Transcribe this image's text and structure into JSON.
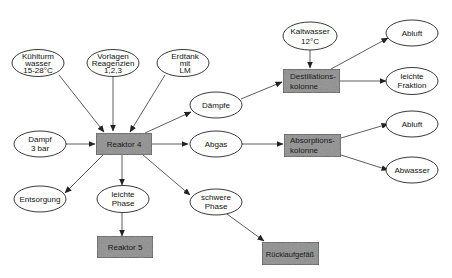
{
  "diagram": {
    "type": "process-flow",
    "nodes": {
      "kuehlturm": {
        "shape": "ellipse",
        "lines": [
          "Kühlturm",
          "wasser",
          "15-28°C"
        ]
      },
      "vorlagen": {
        "shape": "ellipse",
        "lines": [
          "Vorlagen",
          "Reagenzien",
          "1,2,3"
        ]
      },
      "erdtank": {
        "shape": "ellipse",
        "lines": [
          "Erdtank",
          "mit",
          "LM"
        ]
      },
      "dampf": {
        "shape": "ellipse",
        "lines": [
          "Dampf",
          "3 bar"
        ]
      },
      "reaktor4": {
        "shape": "box",
        "lines": [
          "Reaktor 4"
        ]
      },
      "entsorgung": {
        "shape": "ellipse",
        "lines": [
          "Entsorgung"
        ]
      },
      "leichte_phase": {
        "shape": "ellipse",
        "lines": [
          "leichte",
          "Phase"
        ]
      },
      "schwere_phase": {
        "shape": "ellipse",
        "lines": [
          "schwere",
          "Phase"
        ]
      },
      "reaktor5": {
        "shape": "box",
        "lines": [
          "Reaktor 5"
        ]
      },
      "ruecklauf": {
        "shape": "box",
        "lines": [
          "Rücklaufgefäß"
        ]
      },
      "daempfe": {
        "shape": "ellipse",
        "lines": [
          "Dämpfe"
        ]
      },
      "abgas": {
        "shape": "ellipse",
        "lines": [
          "Abgas"
        ]
      },
      "kaltwasser": {
        "shape": "ellipse",
        "lines": [
          "Kaltwasser",
          "12°C"
        ]
      },
      "destillation": {
        "shape": "box",
        "lines": [
          "Destillations-",
          "kolonne"
        ]
      },
      "absorption": {
        "shape": "box",
        "lines": [
          "Absorptions-",
          "kolonne"
        ]
      },
      "abluft1": {
        "shape": "ellipse",
        "lines": [
          "Abluft"
        ]
      },
      "leichte_fraktion": {
        "shape": "ellipse",
        "lines": [
          "leichte",
          "Fraktion"
        ]
      },
      "abluft2": {
        "shape": "ellipse",
        "lines": [
          "Abluft"
        ]
      },
      "abwasser": {
        "shape": "ellipse",
        "lines": [
          "Abwasser"
        ]
      }
    },
    "edges": [
      {
        "from": "kuehlturm",
        "to": "reaktor4"
      },
      {
        "from": "vorlagen",
        "to": "reaktor4"
      },
      {
        "from": "erdtank",
        "to": "reaktor4"
      },
      {
        "from": "dampf",
        "to": "reaktor4"
      },
      {
        "from": "reaktor4",
        "to": "daempfe"
      },
      {
        "from": "reaktor4",
        "to": "abgas"
      },
      {
        "from": "reaktor4",
        "to": "entsorgung"
      },
      {
        "from": "reaktor4",
        "to": "leichte_phase"
      },
      {
        "from": "reaktor4",
        "to": "schwere_phase"
      },
      {
        "from": "leichte_phase",
        "to": "reaktor5"
      },
      {
        "from": "schwere_phase",
        "to": "ruecklauf"
      },
      {
        "from": "daempfe",
        "to": "destillation"
      },
      {
        "from": "kaltwasser",
        "to": "destillation"
      },
      {
        "from": "destillation",
        "to": "abluft1"
      },
      {
        "from": "destillation",
        "to": "leichte_fraktion"
      },
      {
        "from": "abgas",
        "to": "absorption"
      },
      {
        "from": "absorption",
        "to": "abluft2"
      },
      {
        "from": "absorption",
        "to": "abwasser"
      }
    ],
    "colors": {
      "box_fill": "#8e8e8e",
      "stroke": "#333333",
      "background": "#ffffff"
    }
  }
}
